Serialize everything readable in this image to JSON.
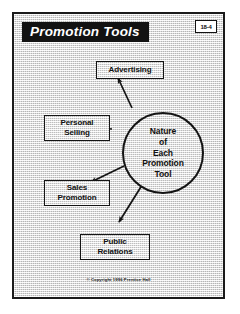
{
  "slide": {
    "title": "Promotion Tools",
    "page_badge": "18-4",
    "copyright": "© Copyright 1996 Prentice Hall",
    "colors": {
      "frame_border": "#1a1a1a",
      "banner_background": "#121212",
      "banner_text": "#ffffff",
      "page_background": "#ffffff",
      "slide_background": "#d8d8d8",
      "shape_fill": "#dedede",
      "shape_border": "#141414",
      "text": "#111111"
    }
  },
  "hub": {
    "name": "nature-of-each-promotion-tool",
    "label": "Nature\nof\nEach\nPromotion\nTool",
    "shape": "circle"
  },
  "tools": [
    {
      "id": "advertising",
      "label": "Advertising",
      "x": 78,
      "y": 47,
      "width": 72,
      "height": 22
    },
    {
      "id": "personal-selling",
      "label": "Personal\nSelling",
      "x": 26,
      "y": 101,
      "width": 70,
      "height": 30
    },
    {
      "id": "sales-promotion",
      "label": "Sales\nPromotion",
      "x": 26,
      "y": 166,
      "width": 70,
      "height": 30
    },
    {
      "id": "public-relations",
      "label": "Public\nRelations",
      "x": 62,
      "y": 220,
      "width": 74,
      "height": 30
    }
  ],
  "connectors": [
    {
      "id": "hub-to-advertising",
      "from": "hub",
      "to": "advertising",
      "arrow_at": "target"
    },
    {
      "id": "hub-to-personal-selling",
      "from": "hub",
      "to": "personal-selling",
      "arrow_at": "target"
    },
    {
      "id": "hub-to-sales-promotion",
      "from": "hub",
      "to": "sales-promotion",
      "arrow_at": "target"
    },
    {
      "id": "hub-to-public-relations",
      "from": "hub",
      "to": "public-relations",
      "arrow_at": "target"
    }
  ]
}
